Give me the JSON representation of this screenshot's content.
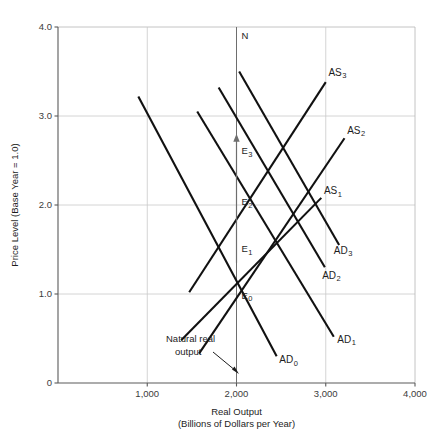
{
  "chart_data": {
    "type": "line",
    "title": "",
    "xlabel": "Real Output",
    "xlabel_sub": "(Billions of Dollars per Year)",
    "ylabel": "Price Level (Base Year = 1.0)",
    "xlim": [
      0,
      4000
    ],
    "ylim": [
      0,
      4.0
    ],
    "xticks": [
      "1,000",
      "2,000",
      "3,000",
      "4,000"
    ],
    "xtick_values": [
      1000,
      2000,
      3000,
      4000
    ],
    "yticks": [
      "0",
      "1.0",
      "2.0",
      "3.0",
      "4.0"
    ],
    "ytick_values": [
      0,
      1.0,
      2.0,
      3.0,
      4.0
    ],
    "grid": true,
    "legend": "none",
    "natural_output": 2000,
    "natural_output_label": "N",
    "annotation": {
      "line1": "Natural real",
      "line2": "output"
    },
    "series": [
      {
        "name": "AD0",
        "label": "AD",
        "sub": "0",
        "kind": "demand",
        "points": [
          [
            900,
            3.22
          ],
          [
            2450,
            0.3
          ]
        ],
        "label_pos": [
          2480,
          0.22
        ]
      },
      {
        "name": "AD1",
        "label": "AD",
        "sub": "1",
        "kind": "demand",
        "points": [
          [
            1560,
            3.05
          ],
          [
            3090,
            0.52
          ]
        ],
        "label_pos": [
          3130,
          0.45
        ]
      },
      {
        "name": "AD2",
        "label": "AD",
        "sub": "2",
        "kind": "demand",
        "points": [
          [
            1800,
            3.32
          ],
          [
            2990,
            1.3
          ]
        ],
        "label_pos": [
          2960,
          1.17
        ]
      },
      {
        "name": "AD3",
        "label": "AD",
        "sub": "3",
        "kind": "demand",
        "points": [
          [
            2030,
            3.5
          ],
          [
            3150,
            1.55
          ]
        ],
        "label_pos": [
          3090,
          1.45
        ]
      },
      {
        "name": "AS1",
        "label": "AS",
        "sub": "1",
        "kind": "supply",
        "points": [
          [
            1380,
            0.48
          ],
          [
            2950,
            2.08
          ]
        ],
        "label_pos": [
          2980,
          2.12
        ]
      },
      {
        "name": "AS2",
        "label": "AS",
        "sub": "2",
        "kind": "supply",
        "points": [
          [
            1580,
            0.33
          ],
          [
            3210,
            2.75
          ]
        ],
        "label_pos": [
          3240,
          2.8
        ]
      },
      {
        "name": "AS3",
        "label": "AS",
        "sub": "3",
        "kind": "supply",
        "points": [
          [
            1470,
            1.02
          ],
          [
            3000,
            3.38
          ]
        ],
        "label_pos": [
          3030,
          3.45
        ]
      }
    ],
    "equilibria": [
      {
        "name": "E0",
        "label": "E",
        "sub": "0",
        "x": 2000,
        "y": 1.0
      },
      {
        "name": "E1",
        "label": "E",
        "sub": "1",
        "x": 2000,
        "y": 1.52
      },
      {
        "name": "E2",
        "label": "E",
        "sub": "2",
        "x": 2000,
        "y": 2.05
      },
      {
        "name": "E3",
        "label": "E",
        "sub": "3",
        "x": 2000,
        "y": 2.62
      }
    ],
    "colors": {
      "curve": "#111111",
      "grid": "#c9c9c9",
      "axis": "#5a5a5a",
      "text": "#1d1d1d",
      "background": "#ffffff"
    }
  }
}
